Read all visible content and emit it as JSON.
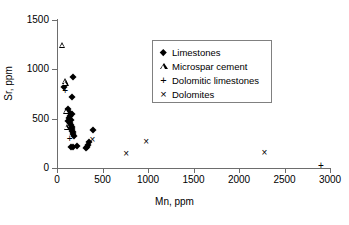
{
  "chart_data": {
    "type": "scatter",
    "title": "",
    "xlabel": "Mn, ppm",
    "ylabel": "Sr, ppm",
    "xlim": [
      0,
      3000
    ],
    "ylim": [
      0,
      1500
    ],
    "xticks": [
      0,
      500,
      1000,
      1500,
      2000,
      2500,
      3000
    ],
    "yticks": [
      0,
      500,
      1000,
      1500
    ],
    "xtick_labels": [
      "0",
      "500",
      "1000",
      "1500",
      "2000",
      "2500",
      "3000"
    ],
    "ytick_labels": [
      "0",
      "500",
      "1000",
      "1500"
    ],
    "grid": false,
    "legend_position": "upper center",
    "series": [
      {
        "name": "Limestones",
        "marker": "filled-diamond",
        "color": "#000000",
        "points": [
          [
            80,
            820
          ],
          [
            175,
            925
          ],
          [
            165,
            715
          ],
          [
            120,
            600
          ],
          [
            130,
            570
          ],
          [
            160,
            545
          ],
          [
            145,
            530
          ],
          [
            135,
            505
          ],
          [
            150,
            490
          ],
          [
            120,
            480
          ],
          [
            140,
            455
          ],
          [
            155,
            440
          ],
          [
            165,
            420
          ],
          [
            150,
            405
          ],
          [
            170,
            395
          ],
          [
            160,
            375
          ],
          [
            180,
            360
          ],
          [
            175,
            340
          ],
          [
            190,
            325
          ],
          [
            150,
            215
          ],
          [
            175,
            215
          ],
          [
            215,
            220
          ],
          [
            320,
            205
          ],
          [
            330,
            215
          ],
          [
            345,
            230
          ],
          [
            350,
            260
          ],
          [
            400,
            385
          ]
        ]
      },
      {
        "name": "Microspar cement",
        "marker": "open-triangle",
        "color": "#000000",
        "points": [
          [
            60,
            1250
          ],
          [
            85,
            880
          ],
          [
            95,
            860
          ],
          [
            100,
            575
          ],
          [
            105,
            415
          ]
        ]
      },
      {
        "name": "Dolomitic limestones",
        "marker": "plus",
        "color": "#000000",
        "points": [
          [
            90,
            790
          ],
          [
            140,
            300
          ],
          [
            2900,
            35
          ]
        ]
      },
      {
        "name": "Dolomites",
        "marker": "cross",
        "color": "#000000",
        "points": [
          [
            390,
            290
          ],
          [
            760,
            155
          ],
          [
            980,
            275
          ],
          [
            2280,
            165
          ]
        ]
      }
    ]
  },
  "legend": {
    "entries": [
      {
        "label": "Limestones",
        "marker": "filled-diamond"
      },
      {
        "label": "Microspar cement",
        "marker": "open-triangle"
      },
      {
        "label": "Dolomitic limestones",
        "marker": "plus"
      },
      {
        "label": "Dolomites",
        "marker": "cross"
      }
    ]
  },
  "symbols": {
    "plus": "+",
    "cross": "×"
  }
}
